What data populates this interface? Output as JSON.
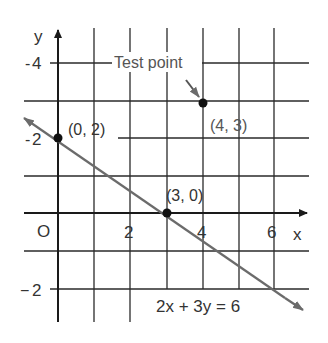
{
  "figure": {
    "axis_labels": {
      "x": "x",
      "y": "y",
      "origin": "O"
    },
    "x_ticks": [
      {
        "value": 2,
        "label": "2"
      },
      {
        "value": 4,
        "label": "4"
      },
      {
        "value": 6,
        "label": "6"
      }
    ],
    "y_ticks": [
      {
        "value": 4,
        "label": "4",
        "sign": "-"
      },
      {
        "value": 2,
        "label": "2",
        "sign": "-"
      },
      {
        "value": -2,
        "label": "2",
        "sign": "−"
      }
    ],
    "points": [
      {
        "name": "y-intercept",
        "x": 0,
        "y": 2,
        "label": "(0, 2)"
      },
      {
        "name": "x-intercept",
        "x": 3,
        "y": 0,
        "label": "(3, 0)"
      },
      {
        "name": "test-point",
        "x": 4,
        "y": 3,
        "label": "(4, 3)"
      }
    ],
    "test_point_callout": "Test point",
    "equation": "2x + 3y = 6",
    "line": {
      "equation": "2x + 3y = 6",
      "slope": -0.6667,
      "intercept": 2
    },
    "grid": {
      "x_range": [
        0,
        6
      ],
      "y_range": [
        -2,
        4
      ],
      "step": 1
    },
    "colors": {
      "line": "#6b6b6b",
      "grid": "#2a2a2a",
      "text": "#333333"
    }
  }
}
